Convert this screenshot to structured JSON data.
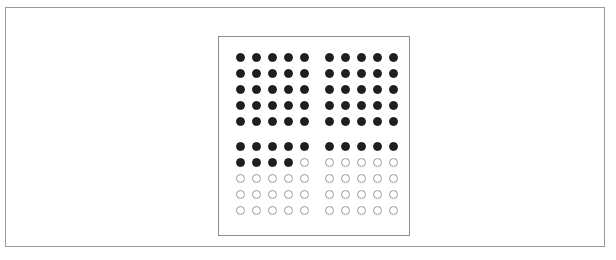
{
  "page": {
    "background_color": "#ffffff",
    "frame_border_color": "#9a9a9a"
  },
  "panel": {
    "border_color": "#8d8d8d",
    "background_color": "#ffffff"
  },
  "legend": {
    "filled_label": "filled",
    "empty_label": "empty",
    "filled_color": "#1f1f1f",
    "empty_outline_color": "#9b9b9b",
    "empty_fill_color": "#ffffff"
  },
  "chart_data": {
    "type": "table",
    "title": "",
    "subtitle": "",
    "xlabel": "",
    "ylabel": "",
    "grid": false,
    "legend_position": "none",
    "rows": 10,
    "columns": 10,
    "row_groups": 2,
    "rows_per_group": 5,
    "column_groups": 2,
    "columns_per_group": 5,
    "total_units": 100,
    "filled_units": 64,
    "empty_units": 36,
    "filled_percent": 64,
    "empty_percent": 36,
    "categories": [
      "filled",
      "empty"
    ],
    "values": [
      64,
      36
    ],
    "matrix": [
      [
        1,
        1,
        1,
        1,
        1,
        1,
        1,
        1,
        1,
        1
      ],
      [
        1,
        1,
        1,
        1,
        1,
        1,
        1,
        1,
        1,
        1
      ],
      [
        1,
        1,
        1,
        1,
        1,
        1,
        1,
        1,
        1,
        1
      ],
      [
        1,
        1,
        1,
        1,
        1,
        1,
        1,
        1,
        1,
        1
      ],
      [
        1,
        1,
        1,
        1,
        1,
        1,
        1,
        1,
        1,
        1
      ],
      [
        1,
        1,
        1,
        1,
        1,
        1,
        1,
        1,
        1,
        1
      ],
      [
        1,
        1,
        1,
        1,
        0,
        0,
        0,
        0,
        0,
        0
      ],
      [
        0,
        0,
        0,
        0,
        0,
        0,
        0,
        0,
        0,
        0
      ],
      [
        0,
        0,
        0,
        0,
        0,
        0,
        0,
        0,
        0,
        0
      ],
      [
        0,
        0,
        0,
        0,
        0,
        0,
        0,
        0,
        0,
        0
      ]
    ],
    "row_filled_counts": [
      10,
      10,
      10,
      10,
      10,
      10,
      4,
      0,
      0,
      0
    ]
  }
}
